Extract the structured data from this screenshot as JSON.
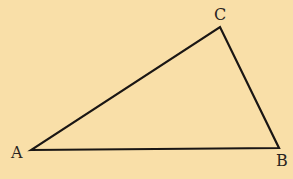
{
  "diagram": {
    "type": "triangle",
    "background": "#f9dfa8",
    "stroke": "#1a1614",
    "vertices": [
      {
        "name": "A",
        "x": 31,
        "y": 150,
        "label_x": 11,
        "label_y": 158
      },
      {
        "name": "B",
        "x": 279,
        "y": 148,
        "label_x": 276,
        "label_y": 166
      },
      {
        "name": "C",
        "x": 220,
        "y": 27,
        "label_x": 214,
        "label_y": 20
      }
    ],
    "labels": {
      "a": "A",
      "b": "B",
      "c": "C"
    }
  }
}
